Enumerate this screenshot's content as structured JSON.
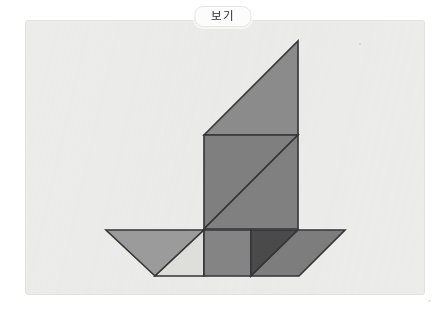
{
  "page": {
    "background_color": "#ffffff",
    "width": 446,
    "height": 312
  },
  "card": {
    "name": "figure-card",
    "background_color": "#ececea",
    "border_color": "#e2e2e0",
    "x": 25,
    "y": 20,
    "width": 400,
    "height": 275
  },
  "label": {
    "text": "보기",
    "background_color": "#fcfcfc",
    "border_color": "#e6e6e4",
    "text_color": "#2e2e2e"
  },
  "figure": {
    "name": "tangram-sailboat",
    "description": "보기",
    "outline_color": "#35353a",
    "piece_count": 7,
    "pieces": [
      {
        "id": "sail-upper-large-triangle",
        "shape": "triangle",
        "fill": "#8b8b8b",
        "points": "204,135 298,41 298,135"
      },
      {
        "id": "sail-lower-large-triangle",
        "shape": "triangle",
        "fill": "#7f7f7f",
        "points": "204,135 298,135 204,229"
      },
      {
        "id": "mast-medium-triangle",
        "shape": "triangle",
        "fill": "#808080",
        "points": "298,135 298,229 204,229"
      },
      {
        "id": "hull-left-medium-triangle",
        "shape": "triangle",
        "fill": "#9b9b9b",
        "points": "106,230 204,230 155,276"
      },
      {
        "id": "hull-left-small-triangle",
        "shape": "triangle",
        "fill": "#dededa",
        "points": "155,276 204,230 204,276"
      },
      {
        "id": "hull-center-square",
        "shape": "square",
        "fill": "#848484",
        "points": "204,230 251,230 251,276 204,276"
      },
      {
        "id": "hull-right-small-triangle",
        "shape": "triangle",
        "fill": "#4a4a4a",
        "points": "251,230 298,230 251,276"
      },
      {
        "id": "hull-right-parallelogram",
        "shape": "parallelogram",
        "fill": "#7d7d7d",
        "points": "298,230 345,230 299,276 251,276"
      }
    ]
  }
}
